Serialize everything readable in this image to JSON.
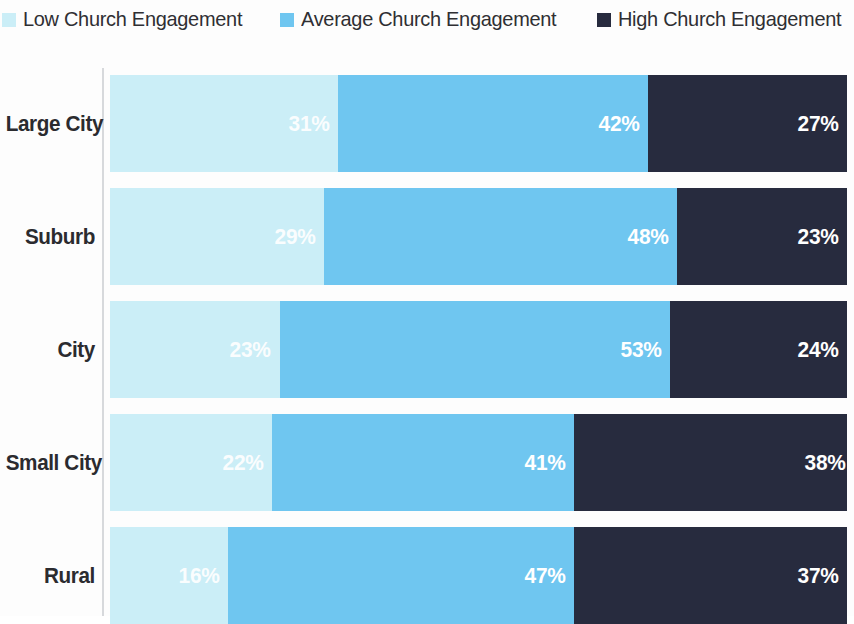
{
  "legend": {
    "items": [
      {
        "label": "Low Church Engagement",
        "color": "#cbeef7",
        "swatch_name": "legend-swatch-low"
      },
      {
        "label": "Average Church Engagement",
        "color": "#6fc6f0",
        "swatch_name": "legend-swatch-average"
      },
      {
        "label": "High Church Engagement",
        "color": "#272b3e",
        "swatch_name": "legend-swatch-high"
      }
    ]
  },
  "chart_data": {
    "type": "bar",
    "orientation": "horizontal",
    "stacked": true,
    "stack_total": 100,
    "title": "",
    "subtitle": "",
    "xlabel": "",
    "ylabel": "",
    "xlim": [
      0,
      100
    ],
    "grid": false,
    "legend_position": "top",
    "value_suffix": "%",
    "categories": [
      "Large City",
      "Suburb",
      "City",
      "Small City",
      "Rural"
    ],
    "series": [
      {
        "name": "Low Church Engagement",
        "color": "#cbeef7",
        "values": [
          31,
          29,
          23,
          22,
          16
        ]
      },
      {
        "name": "Average Church Engagement",
        "color": "#6fc6f0",
        "values": [
          42,
          48,
          53,
          41,
          47
        ]
      },
      {
        "name": "High Church Engagement",
        "color": "#272b3e",
        "values": [
          27,
          23,
          24,
          38,
          37
        ]
      }
    ],
    "labels": [
      [
        "31%",
        "42%",
        "27%"
      ],
      [
        "29%",
        "48%",
        "23%"
      ],
      [
        "23%",
        "53%",
        "24%"
      ],
      [
        "22%",
        "41%",
        "38%"
      ],
      [
        "16%",
        "47%",
        "37%"
      ]
    ]
  }
}
